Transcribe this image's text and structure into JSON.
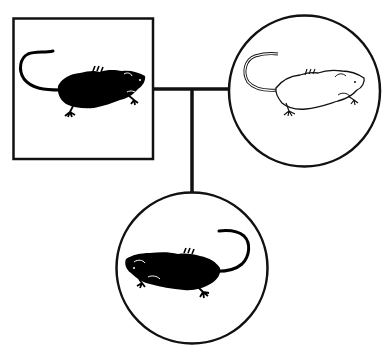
{
  "diagram": {
    "type": "pedigree-cross",
    "background": "#ffffff",
    "line_color": "#111111",
    "parents": [
      {
        "id": "parent-male",
        "shape": "square",
        "phenotype": "black",
        "fill": "#000000"
      },
      {
        "id": "parent-female",
        "shape": "circle",
        "phenotype": "white",
        "fill": "#ffffff"
      }
    ],
    "offspring": [
      {
        "id": "offspring-female",
        "shape": "circle",
        "phenotype": "black",
        "fill": "#000000"
      }
    ],
    "text_labels": []
  }
}
